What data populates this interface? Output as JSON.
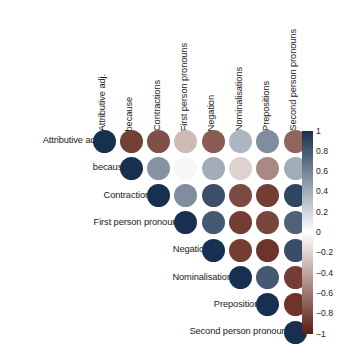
{
  "chart_data": {
    "type": "heatmap",
    "subtype": "correlation-matrix-upper-triangle",
    "title": "",
    "xlabel": "",
    "ylabel": "",
    "grid": false,
    "legend_position": "right",
    "marker": "circle",
    "categories": [
      "Attributive adj.",
      "because",
      "Contractions",
      "First person pronouns",
      "Negation",
      "Nominalisations",
      "Prepositions",
      "Second person pronouns"
    ],
    "row_labels": [
      "Attributive adj.",
      "because",
      "Contractions",
      "First person pronouns",
      "Negation",
      "Nominalisations",
      "Prepositions",
      "Second person pronouns"
    ],
    "column_labels": [
      "Attributive adj.",
      "because",
      "Contractions",
      "First person pronouns",
      "Negation",
      "Nominalisations",
      "Prepositions",
      "Second person pronouns"
    ],
    "zlim": [
      -1,
      1
    ],
    "colorbar": {
      "min": -1,
      "max": 1,
      "ticks": [
        1,
        0.8,
        0.6,
        0.4,
        0.2,
        0,
        -0.2,
        -0.4,
        -0.6,
        -0.8,
        -1
      ],
      "tick_labels": [
        "1",
        "0.8",
        "0.6",
        "0.4",
        "0.2",
        "0",
        "−0.2",
        "−0.4",
        "−0.6",
        "−0.8",
        "−1"
      ],
      "color_high": "#18304f",
      "color_mid": "#ffffff",
      "color_low": "#5c1d12"
    },
    "matrix": [
      [
        1.0,
        -0.85,
        -0.78,
        -0.3,
        -0.72,
        0.35,
        0.55,
        -0.68
      ],
      [
        null,
        1.0,
        0.52,
        0.04,
        0.4,
        -0.2,
        -0.52,
        0.4
      ],
      [
        null,
        null,
        1.0,
        0.55,
        0.85,
        -0.8,
        -0.86,
        0.9
      ],
      [
        null,
        null,
        null,
        1.0,
        0.8,
        -0.86,
        -0.82,
        0.76
      ],
      [
        null,
        null,
        null,
        null,
        1.0,
        -0.86,
        -0.9,
        0.86
      ],
      [
        null,
        null,
        null,
        null,
        null,
        1.0,
        0.8,
        -0.86
      ],
      [
        null,
        null,
        null,
        null,
        null,
        null,
        1.0,
        -0.9
      ],
      [
        null,
        null,
        null,
        null,
        null,
        null,
        null,
        1.0
      ]
    ]
  },
  "layout": {
    "grid_origin_x": 104,
    "grid_origin_y": 141,
    "cell_step": 27.3,
    "dot_diameter": 23,
    "col_header_bottom": 131,
    "row_label_right": 100,
    "colorbar": {
      "x": 302,
      "y": 131,
      "width": 11,
      "height": 203,
      "label_x": 316
    }
  }
}
